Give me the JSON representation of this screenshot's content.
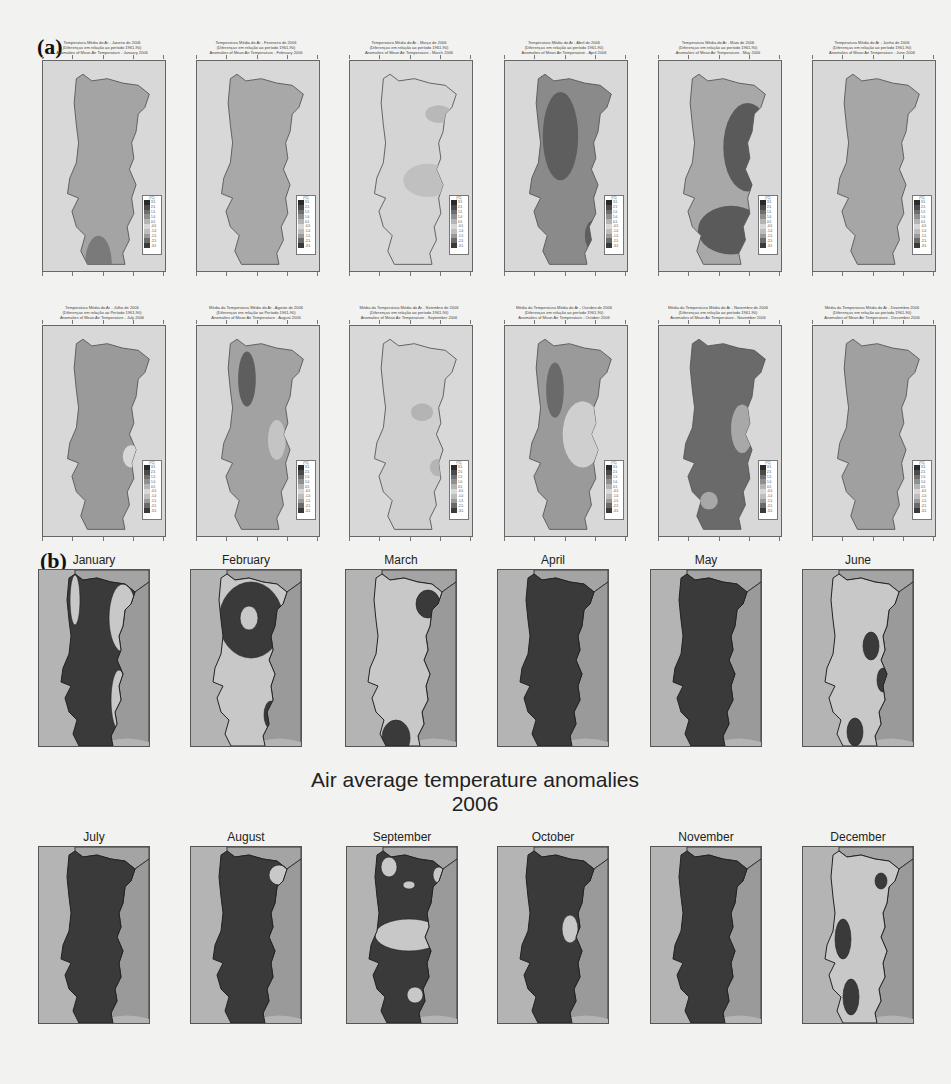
{
  "figure": {
    "panel_a_label": "(a)",
    "panel_b_label": "(b)",
    "main_title_line1": "Air average temperature anomalies",
    "main_title_line2": "2006"
  },
  "panel_a": {
    "legend_unit": "(ºC)",
    "legend_ticks": [
      "3.5",
      "2.5",
      "1.5",
      "1.0",
      "0.5",
      "-0.5",
      "-1.0",
      "-1.5",
      "-2.5",
      "-3.5"
    ],
    "legend_colors": [
      "#2a2a2a",
      "#4a4a4a",
      "#6e6e6e",
      "#8f8f8f",
      "#b4b4b4",
      "#d8d8d8",
      "#bdbdbd",
      "#9a9a9a",
      "#6a6a6a",
      "#3a3a3a"
    ],
    "maps": [
      {
        "month": "January",
        "title": [
          "Temperatura Média do Ar - Janeiro de 2006",
          "(Diferenças em relação ao período 1961-90)",
          "Anomalies of Mean Air Temperature - January 2006"
        ],
        "fill": "#a4a4a4",
        "blobs": [
          {
            "cx": 50,
            "cy": 175,
            "rx": 12,
            "ry": 25,
            "fill": "#7a7a7a"
          }
        ]
      },
      {
        "month": "February",
        "title": [
          "Temperatura Média do Ar - Fevereiro de 2006",
          "(Diferenças em relação ao período 1961-90)",
          "Anomalies of Mean Air Temperature - February 2006"
        ],
        "fill": "#a8a8a8",
        "blobs": []
      },
      {
        "month": "March",
        "title": [
          "Temperatura Média do Ar - Março de 2006",
          "(Diferenças em relação ao período 1961-90)",
          "Anomalies of Mean Air Temperature - March 2006"
        ],
        "fill": "#d4d4d4",
        "blobs": [
          {
            "cx": 70,
            "cy": 100,
            "rx": 22,
            "ry": 15,
            "fill": "#c0c0c0"
          },
          {
            "cx": 80,
            "cy": 40,
            "rx": 12,
            "ry": 8,
            "fill": "#b8b8b8"
          }
        ]
      },
      {
        "month": "April",
        "title": [
          "Temperatura Média do Ar - Abril de 2006",
          "(Diferenças em relação ao período 1961-90)",
          "Anomalies of Mean Air Temperature - April 2006"
        ],
        "fill": "#8a8a8a",
        "blobs": [
          {
            "cx": 50,
            "cy": 60,
            "rx": 16,
            "ry": 40,
            "fill": "#5e5e5e"
          },
          {
            "cx": 80,
            "cy": 150,
            "rx": 8,
            "ry": 14,
            "fill": "#5e5e5e"
          }
        ]
      },
      {
        "month": "May",
        "title": [
          "Temperatura Média do Ar - Maio de 2006",
          "(Diferenças em relação ao período 1961-90)",
          "Anomalies of Mean Air Temperature - May 2006"
        ],
        "fill": "#a8a8a8",
        "blobs": [
          {
            "cx": 80,
            "cy": 70,
            "rx": 22,
            "ry": 40,
            "fill": "#5a5a5a"
          },
          {
            "cx": 65,
            "cy": 145,
            "rx": 30,
            "ry": 22,
            "fill": "#5a5a5a"
          },
          {
            "cx": 65,
            "cy": 195,
            "rx": 20,
            "ry": 6,
            "fill": "#5a5a5a"
          }
        ]
      },
      {
        "month": "June",
        "title": [
          "Temperatura Média do Ar - Junho de 2006",
          "(Diferenças em relação ao período 1961-90)",
          "Anomalies of Mean Air Temperature - June 2006"
        ],
        "fill": "#a6a6a6",
        "blobs": []
      },
      {
        "month": "July",
        "title": [
          "Temperatura Média do Ar - Julho de 2006",
          "(Diferenças em relação ao Período 1961-90)",
          "Anomalies of Mean Air Temperature - July 2006"
        ],
        "fill": "#9a9a9a",
        "blobs": [
          {
            "cx": 80,
            "cy": 110,
            "rx": 8,
            "ry": 10,
            "fill": "#d8d8d8"
          }
        ]
      },
      {
        "month": "August",
        "title": [
          "Média da Temperatura Média do Ar - Agosto de 2006",
          "(Diferenças em relação ao Período 1961-90)",
          "Anomalies of Mean Air Temperature - August 2006"
        ],
        "fill": "#a2a2a2",
        "blobs": [
          {
            "cx": 45,
            "cy": 40,
            "rx": 8,
            "ry": 25,
            "fill": "#5e5e5e"
          },
          {
            "cx": 72,
            "cy": 95,
            "rx": 8,
            "ry": 18,
            "fill": "#c4c4c4"
          },
          {
            "cx": 85,
            "cy": 140,
            "rx": 6,
            "ry": 10,
            "fill": "#6e6e6e"
          }
        ]
      },
      {
        "month": "September",
        "title": [
          "Média da Temperatura Média do Ar - Setembro de 2006",
          "(Diferenças em relação ao período 1961-90)",
          "Anomalies of Mean Air Temperature - September 2006"
        ],
        "fill": "#cfcfcf",
        "blobs": [
          {
            "cx": 65,
            "cy": 70,
            "rx": 10,
            "ry": 8,
            "fill": "#b4b4b4"
          },
          {
            "cx": 80,
            "cy": 120,
            "rx": 8,
            "ry": 8,
            "fill": "#b4b4b4"
          }
        ]
      },
      {
        "month": "October",
        "title": [
          "Média da Temperatura Média do Ar - Outubro de 2006",
          "(Diferenças em relação ao período 1961-90)",
          "Anomalies of Mean Air Temperature - October 2006"
        ],
        "fill": "#9a9a9a",
        "blobs": [
          {
            "cx": 45,
            "cy": 50,
            "rx": 8,
            "ry": 25,
            "fill": "#6a6a6a"
          },
          {
            "cx": 70,
            "cy": 90,
            "rx": 18,
            "ry": 30,
            "fill": "#cfcfcf"
          }
        ]
      },
      {
        "month": "November",
        "title": [
          "Média da Temperatura Média do Ar - Novembro de 2006",
          "(Diferenças em relação ao período 1961-90)",
          "Anomalies of Mean Air Temperature - November 2006"
        ],
        "fill": "#6a6a6a",
        "blobs": [
          {
            "cx": 75,
            "cy": 85,
            "rx": 10,
            "ry": 22,
            "fill": "#a8a8a8"
          },
          {
            "cx": 45,
            "cy": 150,
            "rx": 8,
            "ry": 8,
            "fill": "#a8a8a8"
          }
        ]
      },
      {
        "month": "December",
        "title": [
          "Média da Temperatura Média do Ar - Dezembro 2006",
          "(Diferenças em relação ao período 1961-90)",
          "Anomalies of Mean Air Temperature - December 2006"
        ],
        "fill": "#a0a0a0",
        "blobs": []
      }
    ]
  },
  "panel_b": {
    "colors": {
      "sea": "#b4b4b4",
      "spain": "#9a9a9a",
      "north": "#a4a4a4",
      "dark": "#3a3a3a",
      "light": "#c8c8c8",
      "outline": "#222222"
    },
    "maps": [
      {
        "month": "January",
        "base": "dark",
        "blobs": [
          {
            "cx": 84,
            "cy": 48,
            "rx": 14,
            "ry": 34,
            "fill": "light"
          },
          {
            "cx": 80,
            "cy": 130,
            "rx": 8,
            "ry": 30,
            "fill": "light"
          },
          {
            "cx": 36,
            "cy": 30,
            "rx": 5,
            "ry": 25,
            "fill": "light"
          }
        ]
      },
      {
        "month": "February",
        "base": "light",
        "blobs": [
          {
            "cx": 60,
            "cy": 50,
            "rx": 32,
            "ry": 38,
            "fill": "dark"
          },
          {
            "cx": 58,
            "cy": 48,
            "rx": 9,
            "ry": 12,
            "fill": "light"
          },
          {
            "cx": 80,
            "cy": 145,
            "rx": 7,
            "ry": 14,
            "fill": "dark"
          }
        ]
      },
      {
        "month": "March",
        "base": "light",
        "blobs": [
          {
            "cx": 82,
            "cy": 34,
            "rx": 12,
            "ry": 14,
            "fill": "dark"
          },
          {
            "cx": 50,
            "cy": 168,
            "rx": 14,
            "ry": 18,
            "fill": "dark"
          }
        ]
      },
      {
        "month": "April",
        "base": "dark",
        "blobs": []
      },
      {
        "month": "May",
        "base": "dark",
        "blobs": []
      },
      {
        "month": "June",
        "base": "light",
        "blobs": [
          {
            "cx": 68,
            "cy": 76,
            "rx": 8,
            "ry": 14,
            "fill": "dark"
          },
          {
            "cx": 80,
            "cy": 110,
            "rx": 6,
            "ry": 12,
            "fill": "dark"
          },
          {
            "cx": 52,
            "cy": 162,
            "rx": 8,
            "ry": 14,
            "fill": "dark"
          }
        ]
      },
      {
        "month": "July",
        "base": "dark",
        "blobs": []
      },
      {
        "month": "August",
        "base": "dark",
        "blobs": [
          {
            "cx": 88,
            "cy": 28,
            "rx": 10,
            "ry": 10,
            "fill": "light"
          }
        ]
      },
      {
        "month": "September",
        "base": "dark",
        "blobs": [
          {
            "cx": 42,
            "cy": 20,
            "rx": 8,
            "ry": 10,
            "fill": "light"
          },
          {
            "cx": 92,
            "cy": 28,
            "rx": 6,
            "ry": 8,
            "fill": "light"
          },
          {
            "cx": 62,
            "cy": 38,
            "rx": 6,
            "ry": 4,
            "fill": "light"
          },
          {
            "cx": 62,
            "cy": 88,
            "rx": 34,
            "ry": 16,
            "fill": "light"
          },
          {
            "cx": 68,
            "cy": 148,
            "rx": 8,
            "ry": 8,
            "fill": "light"
          }
        ]
      },
      {
        "month": "October",
        "base": "dark",
        "blobs": [
          {
            "cx": 72,
            "cy": 82,
            "rx": 8,
            "ry": 14,
            "fill": "light"
          }
        ]
      },
      {
        "month": "November",
        "base": "dark",
        "blobs": []
      },
      {
        "month": "December",
        "base": "light",
        "blobs": [
          {
            "cx": 78,
            "cy": 34,
            "rx": 6,
            "ry": 8,
            "fill": "dark"
          },
          {
            "cx": 40,
            "cy": 92,
            "rx": 8,
            "ry": 20,
            "fill": "dark"
          },
          {
            "cx": 48,
            "cy": 150,
            "rx": 8,
            "ry": 18,
            "fill": "dark"
          }
        ]
      }
    ]
  }
}
